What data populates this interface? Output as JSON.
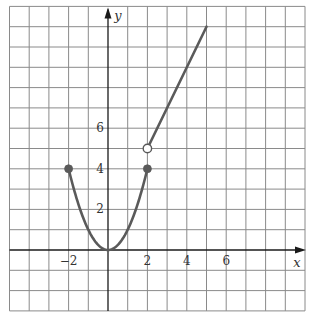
{
  "chart_data": {
    "type": "line",
    "title": "",
    "xlabel": "x",
    "ylabel": "y",
    "xlim": [
      -5,
      10
    ],
    "ylim": [
      -3,
      12
    ],
    "grid": true,
    "grid_step": 1,
    "x_tick_labels": [
      {
        "value": -2,
        "label": "−2"
      },
      {
        "value": 2,
        "label": "2"
      },
      {
        "value": 4,
        "label": "4"
      },
      {
        "value": 6,
        "label": "6"
      }
    ],
    "y_tick_labels": [
      {
        "value": 2,
        "label": "2"
      },
      {
        "value": 4,
        "label": "4"
      },
      {
        "value": 6,
        "label": "6"
      }
    ],
    "series": [
      {
        "name": "parabola piece",
        "formula": "y = x^2",
        "domain": [
          -2,
          2
        ],
        "x": [
          -2,
          -1.5,
          -1,
          -0.5,
          0,
          0.5,
          1,
          1.5,
          2
        ],
        "y": [
          4,
          2.25,
          1,
          0.25,
          0,
          0.25,
          1,
          2.25,
          4
        ],
        "endpoints": [
          {
            "x": -2,
            "y": 4,
            "type": "closed"
          },
          {
            "x": 2,
            "y": 4,
            "type": "closed"
          }
        ]
      },
      {
        "name": "linear piece",
        "formula": "y = 2x + 1",
        "domain": [
          2,
          5
        ],
        "x": [
          2,
          5
        ],
        "y": [
          5,
          11
        ],
        "endpoints": [
          {
            "x": 2,
            "y": 5,
            "type": "open"
          }
        ]
      }
    ],
    "colors": {
      "curve": "#5a5a5a",
      "dot": "#5a5a5a",
      "grid": "#8a8a8a",
      "axis": "#1a1a1a",
      "background": "#ffffff"
    }
  }
}
